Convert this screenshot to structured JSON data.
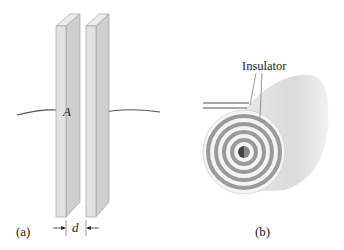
{
  "figure": {
    "panel_a": {
      "label": "(a)",
      "area_label": "A",
      "separation_label": "d",
      "description": "Parallel-plate capacitor: two plates of area A separated by distance d, with connecting wires"
    },
    "panel_b": {
      "label": "(b)",
      "callout_label": "Insulator",
      "description": "Rolled (spiral) capacitor with insulator layers between conducting sheets"
    },
    "colors": {
      "plate_front": "#e2e2e2",
      "plate_side": "#cfcfcf",
      "plate_top": "#ececec",
      "wire": "#555555",
      "spiral_dark": "#9a9a9a",
      "spiral_light": "#f4f4f4",
      "cylinder_body": "#dcdcdc",
      "core": "#444444"
    }
  }
}
